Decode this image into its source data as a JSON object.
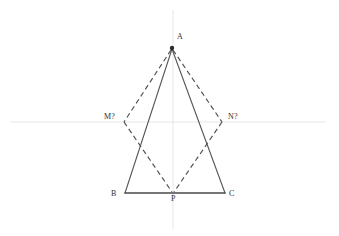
{
  "figure": {
    "background_color": "#ffffff",
    "width": 339,
    "height": 236
  },
  "colors": {
    "axis": "#e6e6e6",
    "solid_edge": "#565656",
    "base_edge": "#4a4a4a",
    "dashed_edge": "#4f4f4f",
    "label_text": "#2e2e2e",
    "vertex_dot": "#2b2b2b"
  },
  "axes": {
    "horizontal": {
      "name": "x-axis",
      "x1": 10,
      "y1": 122,
      "x2": 326,
      "y2": 122
    },
    "vertical": {
      "name": "y-axis",
      "x1": 173,
      "y1": 10,
      "x2": 173,
      "y2": 229
    }
  },
  "points": [
    {
      "id": "A",
      "label": "A",
      "x": 172,
      "y": 48,
      "label_x": 177,
      "label_y": 33,
      "dot": true
    },
    {
      "id": "B",
      "label": "B",
      "x": 125,
      "y": 193,
      "label_x": 111,
      "label_y": 190,
      "dot": false
    },
    {
      "id": "C",
      "label": "C",
      "x": 225,
      "y": 193,
      "label_x": 229,
      "label_y": 190,
      "dot": false
    },
    {
      "id": "P",
      "label": "P",
      "x": 173,
      "y": 193,
      "label_x": 171,
      "label_y": 195,
      "dot": false
    },
    {
      "id": "M",
      "label": "M?",
      "x": 124,
      "y": 122,
      "label_x": 104,
      "label_y": 113,
      "dot": false
    },
    {
      "id": "N",
      "label": "N?",
      "x": 222,
      "y": 122,
      "label_x": 228,
      "label_y": 113,
      "dot": false
    }
  ],
  "edges": {
    "solid": [
      {
        "name": "segment-AB",
        "x1": 172,
        "y1": 49,
        "x2": 125,
        "y2": 193
      },
      {
        "name": "segment-AC",
        "x1": 172,
        "y1": 49,
        "x2": 225,
        "y2": 193
      }
    ],
    "base": [
      {
        "name": "segment-BC",
        "x1": 125,
        "y1": 193,
        "x2": 225,
        "y2": 193
      }
    ],
    "dashed": [
      {
        "name": "segment-AM",
        "x1": 171,
        "y1": 50,
        "x2": 124,
        "y2": 122
      },
      {
        "name": "segment-AN",
        "x1": 173,
        "y1": 50,
        "x2": 222,
        "y2": 122
      },
      {
        "name": "segment-MP",
        "x1": 124,
        "y1": 122,
        "x2": 172,
        "y2": 192
      },
      {
        "name": "segment-NP",
        "x1": 222,
        "y1": 122,
        "x2": 174,
        "y2": 192
      }
    ]
  }
}
